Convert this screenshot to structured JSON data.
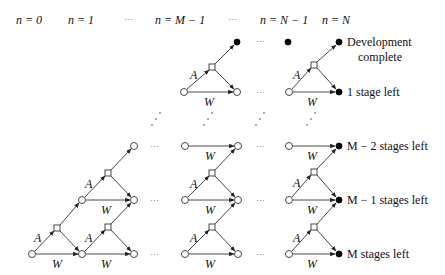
{
  "diagram": {
    "stage_headers": [
      {
        "text": "n = 0",
        "x": 16
      },
      {
        "text": "n = 1",
        "x": 68
      },
      {
        "text": "···",
        "x": 124,
        "ellipsis": true
      },
      {
        "text": "n = M − 1",
        "x": 155
      },
      {
        "text": "···",
        "x": 228,
        "ellipsis": true
      },
      {
        "text": "n = N − 1",
        "x": 260
      },
      {
        "text": "n = N",
        "x": 322
      }
    ],
    "state_labels": [
      {
        "text": "Development",
        "x": 347,
        "y": 46
      },
      {
        "text": "complete",
        "x": 358,
        "y": 61
      },
      {
        "text": "1 stage left",
        "x": 347,
        "y": 96
      },
      {
        "text": "M − 2 stages left",
        "x": 347,
        "y": 150
      },
      {
        "text": "M − 1 stages left",
        "x": 347,
        "y": 204
      },
      {
        "text": "M stages left",
        "x": 347,
        "y": 258
      }
    ],
    "edge_labels": {
      "advance": "A",
      "wait": "W"
    },
    "legend_meaning": {
      "open_circle": "state node",
      "filled_circle": "terminal/final stage node",
      "square": "decision node"
    }
  }
}
